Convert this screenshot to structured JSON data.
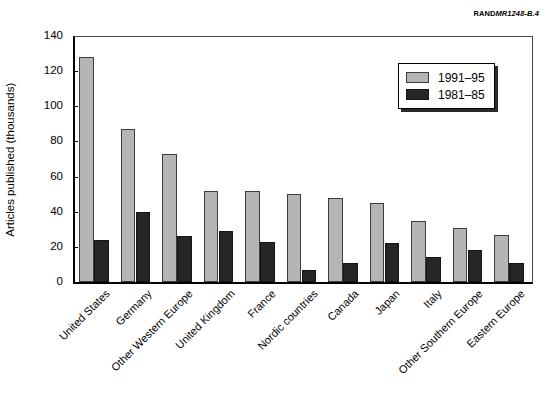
{
  "source_credit": {
    "prefix": "RAND",
    "code": "MR1248-B.4"
  },
  "legend": {
    "position": "top-right-inside",
    "entries": [
      {
        "label": "1991–95",
        "color": "#b5b5b5",
        "name": "series-1991-95"
      },
      {
        "label": "1981–85",
        "color": "#262626",
        "name": "series-1981-85"
      }
    ]
  },
  "chart_data": {
    "type": "bar",
    "title": "",
    "subtitle": "",
    "xlabel": "",
    "ylabel": "Articles published (thousands)",
    "ylim": [
      0,
      140
    ],
    "yticks": [
      0,
      20,
      40,
      60,
      80,
      100,
      120,
      140
    ],
    "ytick_labels": [
      "0",
      "20",
      "40",
      "60",
      "80",
      "100",
      "120",
      "140"
    ],
    "grid": false,
    "legend_position": "upper right",
    "categories": [
      "United States",
      "Germany",
      "Other Western Europe",
      "United Kingdom",
      "France",
      "Nordic countries",
      "Canada",
      "Japan",
      "Italy",
      "Other Southern Europe",
      "Eastern Europe"
    ],
    "series": [
      {
        "name": "1991–95",
        "color": "#b5b5b5",
        "values": [
          128,
          87,
          73,
          52,
          52,
          50,
          48,
          45,
          35,
          31,
          27
        ]
      },
      {
        "name": "1981–85",
        "color": "#262626",
        "values": [
          24,
          40,
          26,
          29,
          23,
          7,
          11,
          22,
          14,
          18,
          11
        ]
      }
    ]
  }
}
